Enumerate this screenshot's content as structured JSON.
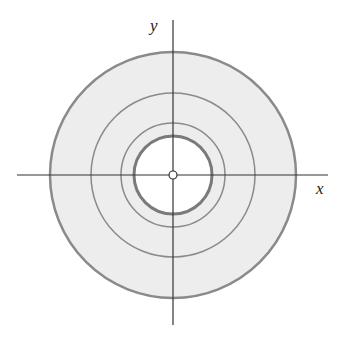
{
  "diagram": {
    "title": "",
    "center": {
      "cx": 173,
      "cy": 175
    },
    "axes": {
      "x_label": "x",
      "y_label": "y",
      "x_range": [
        17,
        328
      ],
      "y_range": [
        20,
        325
      ],
      "color": "#333333"
    },
    "region": {
      "description": "Shaded annulus between inner and outer circles",
      "fill": "#ededed",
      "outer_radius": 123,
      "inner_radius": 39
    },
    "circles": [
      {
        "name": "outer-circle",
        "r": 123,
        "stroke": "#8a8a8a",
        "width": 2.5
      },
      {
        "name": "middle-circle",
        "r": 82,
        "stroke": "#8a8a8a",
        "width": 1.5
      },
      {
        "name": "third-circle",
        "r": 52,
        "stroke": "#8a8a8a",
        "width": 1.5
      },
      {
        "name": "inner-circle",
        "r": 39,
        "stroke": "#7a7a7a",
        "width": 3
      }
    ],
    "origin_marker": {
      "r": 4,
      "fill": "#ffffff",
      "stroke": "#333333"
    }
  }
}
